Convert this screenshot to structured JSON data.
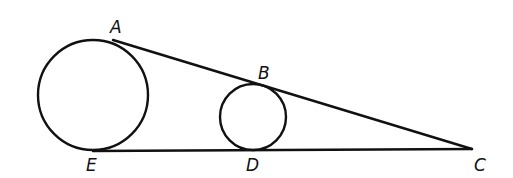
{
  "diagram": {
    "type": "geometry",
    "stroke_color": "#111111",
    "background": "#ffffff",
    "points": {
      "A": {
        "label": "A",
        "x": 113,
        "y": 40,
        "label_x": 110,
        "label_y": 33
      },
      "B": {
        "label": "B",
        "x": 258,
        "y": 85,
        "label_x": 258,
        "label_y": 79
      },
      "C": {
        "label": "C",
        "x": 472,
        "y": 149,
        "label_x": 474,
        "label_y": 171
      },
      "D": {
        "label": "D",
        "x": 253,
        "y": 151,
        "label_x": 246,
        "label_y": 171
      },
      "E": {
        "label": "E",
        "x": 93,
        "y": 151,
        "label_x": 86,
        "label_y": 171
      }
    },
    "circles": [
      {
        "name": "large-circle",
        "cx": 93,
        "cy": 95,
        "r": 55
      },
      {
        "name": "small-circle",
        "cx": 253,
        "cy": 117,
        "r": 33
      }
    ],
    "segments": [
      {
        "name": "line-AC",
        "from": "A",
        "to": "C"
      },
      {
        "name": "line-EC",
        "from": "E",
        "to": "C"
      }
    ]
  }
}
